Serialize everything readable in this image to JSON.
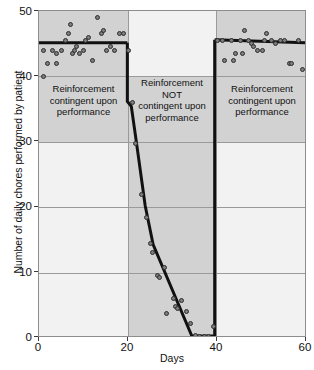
{
  "chart_data": {
    "type": "scatter",
    "title": "",
    "xlabel": "Days",
    "ylabel": "Number of daily chores performed by patient",
    "xlim": [
      0,
      60
    ],
    "ylim": [
      0,
      50
    ],
    "xticks": [
      0,
      20,
      40,
      60
    ],
    "yticks": [
      0,
      10,
      20,
      30,
      40,
      50
    ],
    "grid": true,
    "legend": "none",
    "phases": [
      {
        "name": "baseline-reinforcement",
        "label": "Reinforcement\ncontingent upon\nperformance",
        "label_line1": "Reinforcement",
        "label_line2": "contingent upon",
        "label_line3": "performance",
        "x_start": 0,
        "x_end": 20,
        "trend_level": 45
      },
      {
        "name": "noncontingent-reinforcement",
        "label": "Reinforcement\nNOT\ncontingent upon\nperformance",
        "label_line1": "Reinforcement",
        "label_line2": "NOT",
        "label_line3": "contingent upon",
        "label_line4": "performance",
        "x_start": 20,
        "x_end": 40,
        "trend_start": 45,
        "trend_end": 0
      },
      {
        "name": "reinstated-reinforcement",
        "label": "Reinforcement\ncontingent upon\nperformance",
        "label_line1": "Reinforcement",
        "label_line2": "contingent upon",
        "label_line3": "performance",
        "x_start": 40,
        "x_end": 60,
        "trend_level": 45
      }
    ],
    "series": [
      {
        "name": "daily-chores-observed",
        "marker": "filled-circle",
        "marker_color": "#7d7d7d",
        "marker_edge_color": "#2e2e2e",
        "points": [
          [
            1,
            40
          ],
          [
            1,
            44
          ],
          [
            2,
            42
          ],
          [
            3,
            44
          ],
          [
            4,
            43.5
          ],
          [
            4,
            42
          ],
          [
            5,
            44
          ],
          [
            6,
            45.5
          ],
          [
            6.5,
            46.5
          ],
          [
            7,
            48
          ],
          [
            7.5,
            43.5
          ],
          [
            8,
            44
          ],
          [
            8.5,
            44.5
          ],
          [
            9,
            43.5
          ],
          [
            10,
            44
          ],
          [
            10.5,
            45.5
          ],
          [
            11,
            46
          ],
          [
            12,
            42.5
          ],
          [
            13,
            49
          ],
          [
            14,
            46.5
          ],
          [
            14.5,
            47
          ],
          [
            15,
            44
          ],
          [
            16,
            44.5
          ],
          [
            17,
            44
          ],
          [
            18,
            46.5
          ],
          [
            19,
            46.5
          ],
          [
            20,
            44
          ],
          [
            21,
            36
          ],
          [
            21.5,
            29.8
          ],
          [
            23,
            22
          ],
          [
            24,
            18.5
          ],
          [
            25,
            14.5
          ],
          [
            25.5,
            13
          ],
          [
            26.5,
            9.6
          ],
          [
            27,
            9.2
          ],
          [
            28,
            10.8
          ],
          [
            28.5,
            3.8
          ],
          [
            30,
            6
          ],
          [
            30.5,
            4.8
          ],
          [
            31,
            4.5
          ],
          [
            32,
            5.7
          ],
          [
            33,
            4.1
          ],
          [
            34,
            2.2
          ],
          [
            35,
            0.4
          ],
          [
            36,
            0.3
          ],
          [
            37,
            0.3
          ],
          [
            38,
            0.3
          ],
          [
            39,
            1.8
          ],
          [
            40,
            45.5
          ],
          [
            41,
            45.5
          ],
          [
            41.5,
            42.5
          ],
          [
            43,
            45.5
          ],
          [
            43.5,
            42.5
          ],
          [
            44,
            43.5
          ],
          [
            45,
            45.5
          ],
          [
            45.5,
            43.5
          ],
          [
            46,
            47
          ],
          [
            47,
            45.5
          ],
          [
            47.5,
            45
          ],
          [
            48,
            44.5
          ],
          [
            49,
            44
          ],
          [
            50,
            44
          ],
          [
            50.5,
            45.5
          ],
          [
            51,
            46.5
          ],
          [
            52,
            45.5
          ],
          [
            53,
            45
          ],
          [
            54,
            45.5
          ],
          [
            55,
            45.5
          ],
          [
            56,
            42
          ],
          [
            56.5,
            42
          ],
          [
            58,
            45.5
          ],
          [
            59,
            41
          ]
        ]
      }
    ],
    "trend_lines": [
      {
        "name": "phase1-level",
        "points": [
          [
            0,
            45
          ],
          [
            20,
            45
          ]
        ]
      },
      {
        "name": "phase2-decline",
        "points": [
          [
            20,
            45
          ],
          [
            21,
            36
          ],
          [
            22,
            29.8
          ],
          [
            24,
            18.5
          ],
          [
            25.5,
            14
          ],
          [
            34.5,
            0
          ],
          [
            40,
            0
          ]
        ]
      },
      {
        "name": "phase2-drop-edge",
        "points": [
          [
            20,
            45
          ],
          [
            20,
            36
          ]
        ]
      },
      {
        "name": "phase3-rise-edge",
        "points": [
          [
            40,
            0
          ],
          [
            40,
            45.5
          ]
        ]
      },
      {
        "name": "phase3-level",
        "points": [
          [
            40,
            45.5
          ],
          [
            60,
            45
          ]
        ]
      }
    ]
  }
}
